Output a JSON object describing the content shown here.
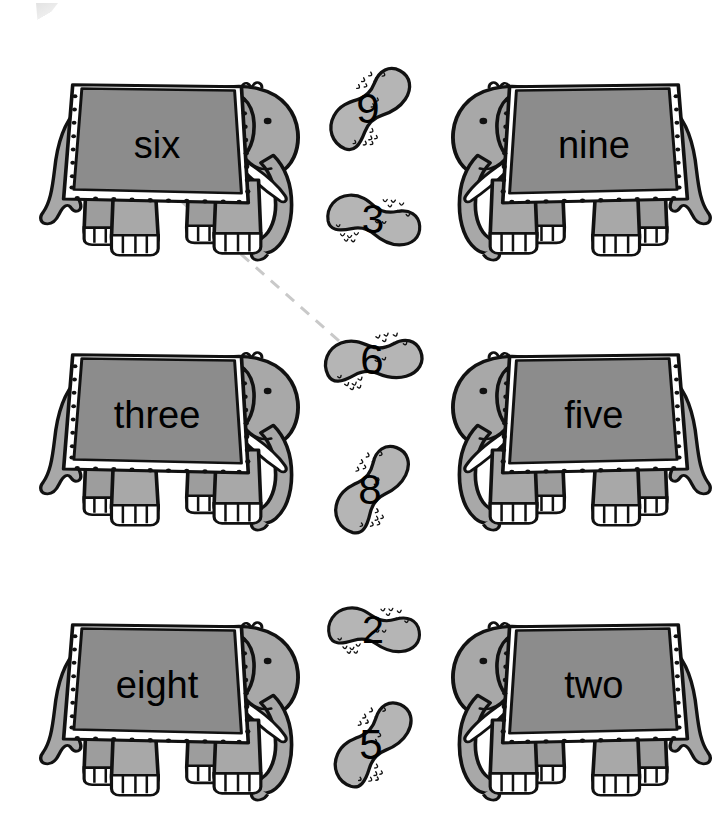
{
  "worksheet": {
    "title": "Elephants and Peanuts Number-Word Matching Worksheet",
    "instruction_visible": "",
    "background_color": "#ffffff",
    "ink_color": "#000000",
    "body_color": "#a8a8a8",
    "blanket_color": "#8c8c8c",
    "peanut_color": "#b5b5b5",
    "tusk_color": "#ffffff",
    "connector_color": "#c9c9c9"
  },
  "elephants": [
    {
      "id": "elephant-six",
      "label": "six",
      "row": 1,
      "column": "left",
      "facing": "right",
      "x": 18,
      "y": 60,
      "w": 285,
      "h": 200
    },
    {
      "id": "elephant-nine",
      "label": "nine",
      "row": 1,
      "column": "right",
      "facing": "left",
      "x": 448,
      "y": 60,
      "w": 285,
      "h": 200
    },
    {
      "id": "elephant-three",
      "label": "three",
      "row": 2,
      "column": "left",
      "facing": "right",
      "x": 18,
      "y": 330,
      "w": 285,
      "h": 200
    },
    {
      "id": "elephant-five",
      "label": "five",
      "row": 2,
      "column": "right",
      "facing": "left",
      "x": 448,
      "y": 330,
      "w": 285,
      "h": 200
    },
    {
      "id": "elephant-eight",
      "label": "eight",
      "row": 3,
      "column": "left",
      "facing": "right",
      "x": 18,
      "y": 600,
      "w": 285,
      "h": 200
    },
    {
      "id": "elephant-two",
      "label": "two",
      "row": 3,
      "column": "right",
      "facing": "left",
      "x": 448,
      "y": 600,
      "w": 285,
      "h": 200
    }
  ],
  "peanuts": [
    {
      "id": "peanut-9",
      "digit": "9",
      "cx": 368,
      "cy": 108,
      "rotation": -62,
      "scale": 1.0
    },
    {
      "id": "peanut-3",
      "digit": "3",
      "cx": 373,
      "cy": 219,
      "rotation": -4,
      "scale": 0.96
    },
    {
      "id": "peanut-6",
      "digit": "6",
      "cx": 372,
      "cy": 359,
      "rotation": -22,
      "scale": 1.0
    },
    {
      "id": "peanut-8",
      "digit": "8",
      "cx": 370,
      "cy": 489,
      "rotation": -70,
      "scale": 1.0
    },
    {
      "id": "peanut-2",
      "digit": "2",
      "cx": 373,
      "cy": 629,
      "rotation": -10,
      "scale": 0.94
    },
    {
      "id": "peanut-5",
      "digit": "5",
      "cx": 371,
      "cy": 744,
      "rotation": -66,
      "scale": 1.0
    }
  ],
  "connectors": [
    {
      "id": "connector-six-to-6",
      "from": "elephant-six",
      "to": "peanut-6",
      "x1": 181,
      "y1": 201,
      "x2": 347,
      "y2": 348,
      "style": "dashed"
    }
  ],
  "answer_key": {
    "six": "6",
    "nine": "9",
    "three": "3",
    "five": "5",
    "eight": "8",
    "two": "2"
  }
}
